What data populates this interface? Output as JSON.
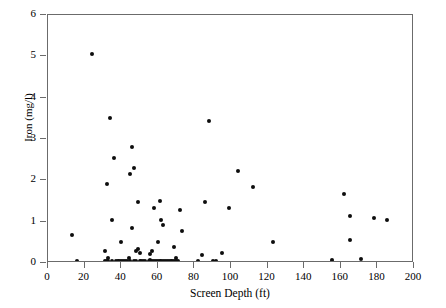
{
  "chart_data": {
    "type": "scatter",
    "title": "",
    "xlabel": "Screen Depth (ft)",
    "ylabel": "Iron (mg/l)",
    "xlim": [
      0,
      200
    ],
    "ylim": [
      0,
      6
    ],
    "xticks": [
      0,
      20,
      40,
      60,
      80,
      100,
      120,
      140,
      160,
      180,
      200
    ],
    "yticks": [
      0,
      1,
      2,
      3,
      4,
      5,
      6
    ],
    "grid": false,
    "legend": null,
    "marker": {
      "shape": "circle",
      "color": "#0d0d0d",
      "size": 4
    },
    "n_points": 86,
    "points": [
      [
        13,
        0.68
      ],
      [
        16,
        0.05
      ],
      [
        24,
        5.05
      ],
      [
        31,
        0.3
      ],
      [
        31,
        0.04
      ],
      [
        32,
        0.05
      ],
      [
        32,
        1.9
      ],
      [
        33,
        0.12
      ],
      [
        33,
        0.04
      ],
      [
        34,
        3.52
      ],
      [
        35,
        0.05
      ],
      [
        35,
        1.05
      ],
      [
        36,
        2.55
      ],
      [
        37,
        0.04
      ],
      [
        38,
        0.05
      ],
      [
        39,
        0.04
      ],
      [
        40,
        0.5
      ],
      [
        40,
        0.05
      ],
      [
        41,
        0.05
      ],
      [
        42,
        0.04
      ],
      [
        43,
        0.05
      ],
      [
        44,
        0.12
      ],
      [
        45,
        0.05
      ],
      [
        45,
        2.15
      ],
      [
        46,
        2.8
      ],
      [
        46,
        0.85
      ],
      [
        47,
        0.04
      ],
      [
        47,
        2.3
      ],
      [
        48,
        0.28
      ],
      [
        48,
        0.05
      ],
      [
        49,
        0.33
      ],
      [
        49,
        1.47
      ],
      [
        50,
        0.25
      ],
      [
        50,
        0.05
      ],
      [
        51,
        0.06
      ],
      [
        52,
        0.04
      ],
      [
        53,
        0.05
      ],
      [
        55,
        0.04
      ],
      [
        56,
        0.22
      ],
      [
        56,
        0.08
      ],
      [
        57,
        0.05
      ],
      [
        57,
        0.3
      ],
      [
        58,
        0.05
      ],
      [
        58,
        1.33
      ],
      [
        59,
        0.04
      ],
      [
        60,
        0.5
      ],
      [
        60,
        0.05
      ],
      [
        61,
        1.5
      ],
      [
        61,
        0.04
      ],
      [
        62,
        1.03
      ],
      [
        62,
        0.05
      ],
      [
        63,
        0.92
      ],
      [
        63,
        0.05
      ],
      [
        64,
        0.04
      ],
      [
        65,
        0.06
      ],
      [
        66,
        0.05
      ],
      [
        67,
        0.04
      ],
      [
        68,
        0.05
      ],
      [
        69,
        0.38
      ],
      [
        69,
        0.05
      ],
      [
        70,
        0.12
      ],
      [
        70,
        0.04
      ],
      [
        71,
        0.05
      ],
      [
        72,
        1.28
      ],
      [
        73,
        0.78
      ],
      [
        82,
        0.04
      ],
      [
        84,
        0.2
      ],
      [
        86,
        1.47
      ],
      [
        88,
        3.43
      ],
      [
        90,
        0.04
      ],
      [
        91,
        0.03
      ],
      [
        92,
        0.05
      ],
      [
        95,
        0.25
      ],
      [
        99,
        1.32
      ],
      [
        104,
        2.22
      ],
      [
        112,
        1.85
      ],
      [
        123,
        0.5
      ],
      [
        155,
        0.08
      ],
      [
        162,
        1.67
      ],
      [
        165,
        1.13
      ],
      [
        165,
        0.55
      ],
      [
        171,
        0.1
      ],
      [
        178,
        1.08
      ],
      [
        185,
        1.03
      ]
    ]
  }
}
